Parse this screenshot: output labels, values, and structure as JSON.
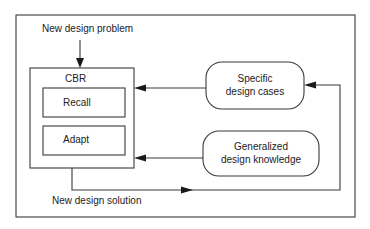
{
  "diagram": {
    "input_label": "New design problem",
    "output_label": "New design solution",
    "cbr": {
      "title": "CBR",
      "steps": [
        {
          "label": "Recall"
        },
        {
          "label": "Adapt"
        }
      ]
    },
    "knowledge_sources": [
      {
        "line1": "Specific",
        "line2": "design cases"
      },
      {
        "line1": "Generalized",
        "line2": "design knowledge"
      }
    ],
    "colors": {
      "line": "#3a3a3a",
      "text": "#222222",
      "background": "#ffffff"
    }
  }
}
